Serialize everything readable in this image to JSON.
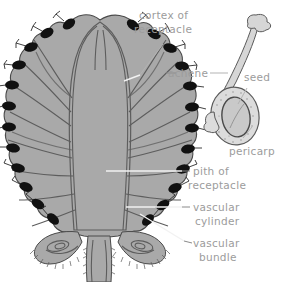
{
  "figure": {
    "background_color": "#ffffff",
    "flesh_color": "#a9a9a9",
    "outline_color": "#4a4a4a",
    "achene_color": "#111111",
    "label_color": "#9c9c9c",
    "leader_white_color": "#f2f2f2",
    "leader_gray_color": "#b3b3b3"
  },
  "labels": {
    "cortex_of_receptacle": {
      "line1": "cortex of",
      "line2": "receptacle"
    },
    "achene": {
      "line1": "achene"
    },
    "seed": {
      "line1": "seed"
    },
    "pericarp": {
      "line1": "pericarp"
    },
    "pith_of_receptacle": {
      "line1": "pith of",
      "line2": "receptacle"
    },
    "vascular_cylinder": {
      "line1": "vascular",
      "line2": "cylinder"
    },
    "vascular_bundle": {
      "line1": "vascular",
      "line2": "bundle"
    }
  },
  "parts": {
    "main_section": "strawberry-longitudinal-section",
    "detail_inset": "single-achene-detail",
    "achene_count_visible": 16,
    "sepal_count_visible": 2
  }
}
